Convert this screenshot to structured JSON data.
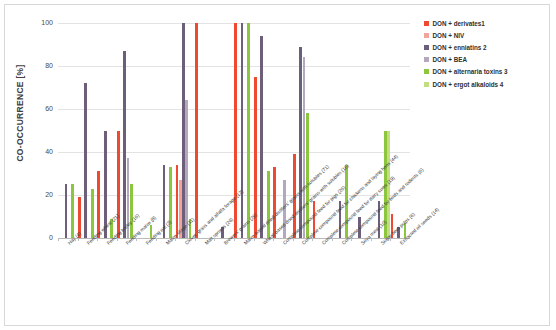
{
  "chart_data": {
    "type": "bar",
    "title": "",
    "xlabel": "",
    "ylabel": "CO-OCCURRENCE [%]",
    "ylim": [
      0,
      100
    ],
    "yticks": [
      0,
      20,
      40,
      60,
      80,
      100
    ],
    "grid": true,
    "legend_position": "right",
    "categories": [
      "Hay (4)",
      "Feeding wheat (21)",
      "Feeding barley (16)",
      "Feeding maize (8)",
      "Feeding oat (3)",
      "Maize silage (11)",
      "Clover, grass and alfalfa forage (12)",
      "Malt sprouts (26)",
      "Brewers' grains (28)",
      "Maize-based dried distillers' grains with solubles (71)",
      "Wheat-based dried distillers' grains with solubles (16)",
      "Complete compound feed for pigs (26)",
      "Complete compound feed for chickens and laying hens (44)",
      "Complete compound feed for dairy cows (19)",
      "Complete compound feed for birds and rodents (6)",
      "Soya meal (10)",
      "Sugar beet pulps (6)",
      "Extracted oil seeds (14)"
    ],
    "series": [
      {
        "name": "DON + derivates1",
        "color": "#ef4a31",
        "values": [
          0,
          19,
          31,
          50,
          0,
          0,
          34,
          100,
          0,
          100,
          75,
          33,
          39,
          17,
          0,
          0,
          0,
          11
        ]
      },
      {
        "name": "DON + NIV",
        "color": "#f3a49a",
        "values": [
          0,
          0,
          0,
          0,
          0,
          0,
          27,
          0,
          0,
          0,
          0,
          0,
          0,
          0,
          0,
          0,
          0,
          0
        ]
      },
      {
        "name": "DON + enniatins 2",
        "color": "#6d5f79",
        "values": [
          25,
          72,
          50,
          87,
          0,
          34,
          100,
          0,
          5,
          100,
          94,
          0,
          89,
          0,
          17,
          10,
          17,
          5
        ]
      },
      {
        "name": "DON + BEA",
        "color": "#b3a8bd",
        "values": [
          0,
          0,
          0,
          37,
          0,
          0,
          64,
          0,
          0,
          0,
          0,
          27,
          84,
          0,
          0,
          0,
          0,
          0
        ]
      },
      {
        "name": "DON + alternaria toxins 3",
        "color": "#8cc63e",
        "values": [
          25,
          23,
          9,
          25,
          6,
          33,
          9,
          0,
          0,
          100,
          31,
          0,
          58,
          0,
          34,
          0,
          50,
          7
        ]
      },
      {
        "name": "DON + ergot alkaloids 4",
        "color": "#c3de7f",
        "values": [
          0,
          0,
          0,
          0,
          0,
          0,
          0,
          0,
          0,
          0,
          0,
          0,
          0,
          0,
          0,
          0,
          50,
          0
        ]
      }
    ]
  },
  "legend": {
    "items": [
      "DON + derivates1",
      "DON + NIV",
      "DON + enniatins 2",
      "DON + BEA",
      "DON + alternaria toxins 3",
      "DON + ergot alkaloids 4"
    ]
  }
}
